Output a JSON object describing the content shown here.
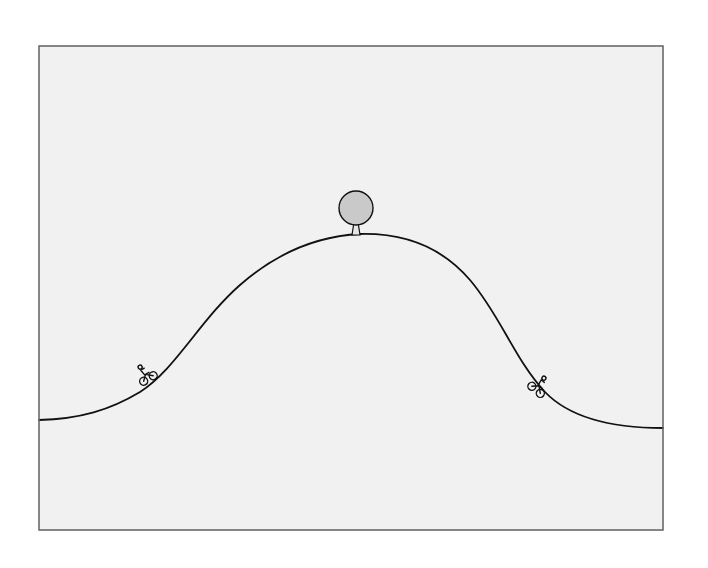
{
  "illustration": {
    "subject": "hill with tree at summit and two cyclists",
    "colors": {
      "paper": "#ffffff",
      "frame_fill": "#f1f1f1",
      "frame_border": "#6a6a6a",
      "ink": "#111111",
      "tree_crown": "#c9c9c9"
    },
    "frame": {
      "x": 39,
      "y": 46,
      "width": 624,
      "height": 484
    },
    "hill": {
      "left_end": [
        39,
        420
      ],
      "peak": [
        360,
        234
      ],
      "right_end": [
        663,
        428
      ]
    },
    "tree": {
      "x": 356,
      "base_y": 235,
      "crown_radius": 18
    },
    "cyclists": [
      {
        "name": "left-cyclist",
        "x": 147,
        "y": 377,
        "direction": "uphill-right"
      },
      {
        "name": "right-cyclist",
        "x": 537,
        "y": 388,
        "direction": "downhill-right"
      }
    ]
  }
}
